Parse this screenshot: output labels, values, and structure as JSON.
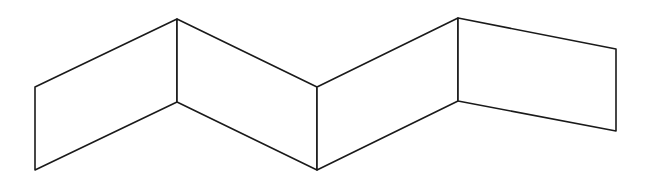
{
  "diagram": {
    "type": "folded-screen",
    "stroke_color": "#1a1a1a",
    "background_color": "#ffffff",
    "panels": [
      {
        "name": "panel-1",
        "points": [
          [
            35,
            87
          ],
          [
            177,
            19
          ],
          [
            177,
            102
          ],
          [
            35,
            170
          ]
        ]
      },
      {
        "name": "panel-2",
        "points": [
          [
            177,
            19
          ],
          [
            317,
            87
          ],
          [
            317,
            170
          ],
          [
            177,
            102
          ]
        ]
      },
      {
        "name": "panel-3",
        "points": [
          [
            317,
            87
          ],
          [
            458,
            18
          ],
          [
            458,
            101
          ],
          [
            317,
            170
          ]
        ]
      },
      {
        "name": "panel-4",
        "points": [
          [
            458,
            18
          ],
          [
            616,
            49
          ],
          [
            616,
            131
          ],
          [
            458,
            101
          ]
        ]
      }
    ]
  }
}
